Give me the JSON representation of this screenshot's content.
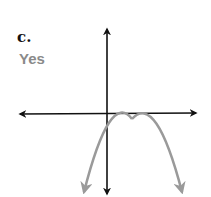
{
  "problem": {
    "letter": "c.",
    "answer": "Yes",
    "answer_color": "#8a8a8a"
  },
  "graph": {
    "axes": {
      "x_axis": "horizontal with arrows both ends",
      "y_axis": "vertical with arrows both ends",
      "color": "#111111"
    },
    "curve": {
      "type": "downward-opening parabola",
      "vertex": "right of y-axis, just below x-axis",
      "color": "#9a9a9a",
      "arrows": "both ends pointing down"
    }
  }
}
